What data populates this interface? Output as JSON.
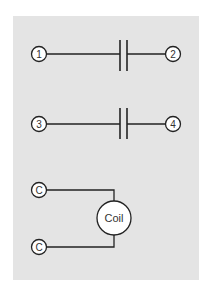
{
  "diagram": {
    "type": "relay-schematic",
    "background_color": "#e4e4e4",
    "line_color": "#222222",
    "contacts": [
      {
        "id": "contact-1-2",
        "left_terminal": "1",
        "right_terminal": "2"
      },
      {
        "id": "contact-3-4",
        "left_terminal": "3",
        "right_terminal": "4"
      }
    ],
    "coil": {
      "label": "Coil",
      "terminals": [
        "C",
        "C"
      ]
    }
  }
}
